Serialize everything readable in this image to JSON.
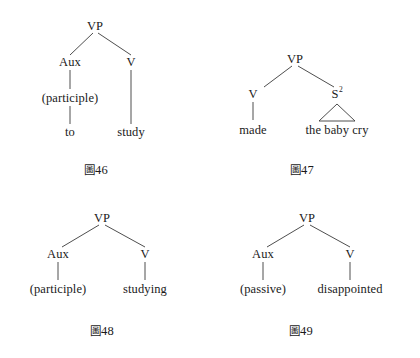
{
  "page": {
    "background_color": "#ffffff",
    "ink_color": "#1a1a1a",
    "width": 420,
    "height": 358
  },
  "figures": [
    {
      "id": "fig-46",
      "caption_mark": "圖",
      "caption_number": "46",
      "root": "VP",
      "nodes": [
        {
          "name": "root",
          "label": "VP"
        },
        {
          "name": "left-child",
          "label": "Aux"
        },
        {
          "name": "right-child",
          "label": "V"
        }
      ],
      "terminals": [
        {
          "name": "aux-feature",
          "label": "(participle)"
        },
        {
          "name": "aux-word",
          "label": "to"
        },
        {
          "name": "verb-word",
          "label": "study"
        }
      ]
    },
    {
      "id": "fig-47",
      "caption_mark": "圖",
      "caption_number": "47",
      "root": "VP",
      "nodes": [
        {
          "name": "root",
          "label": "VP"
        },
        {
          "name": "left-child",
          "label": "V"
        },
        {
          "name": "right-child",
          "label": "S",
          "superscript": "2"
        }
      ],
      "terminals": [
        {
          "name": "verb-word",
          "label": "made"
        },
        {
          "name": "clause-phrase",
          "label": "the baby cry"
        }
      ],
      "has_triangle": true
    },
    {
      "id": "fig-48",
      "caption_mark": "圖",
      "caption_number": "48",
      "root": "VP",
      "nodes": [
        {
          "name": "root",
          "label": "VP"
        },
        {
          "name": "left-child",
          "label": "Aux"
        },
        {
          "name": "right-child",
          "label": "V"
        }
      ],
      "terminals": [
        {
          "name": "aux-feature",
          "label": "(participle)"
        },
        {
          "name": "verb-word",
          "label": "studying"
        }
      ]
    },
    {
      "id": "fig-49",
      "caption_mark": "圖",
      "caption_number": "49",
      "root": "VP",
      "nodes": [
        {
          "name": "root",
          "label": "VP"
        },
        {
          "name": "left-child",
          "label": "Aux"
        },
        {
          "name": "right-child",
          "label": "V"
        }
      ],
      "terminals": [
        {
          "name": "aux-feature",
          "label": "(passive)"
        },
        {
          "name": "verb-word",
          "label": "disappointed"
        }
      ]
    }
  ]
}
